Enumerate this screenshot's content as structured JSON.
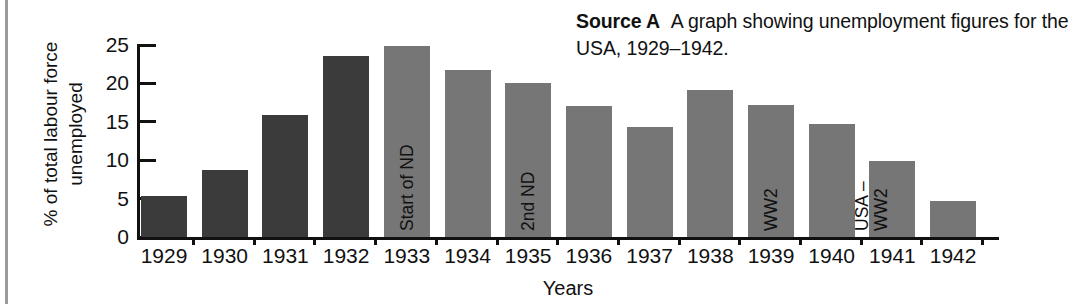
{
  "caption": {
    "source_label": "Source A",
    "description": "A graph showing unemployment figures for the USA, 1929–1942."
  },
  "colors": {
    "bar_dark": "#3b3b3b",
    "bar_light": "#767676",
    "axis": "#111111",
    "text": "#111111",
    "page_edge_rule": "#9a9a9a",
    "background": "#ffffff"
  },
  "chart_data": {
    "type": "bar",
    "title": "",
    "xlabel": "Years",
    "ylabel_line1": "% of total labour force",
    "ylabel_line2": "unemployed",
    "categories": [
      "1929",
      "1930",
      "1931",
      "1932",
      "1933",
      "1934",
      "1935",
      "1936",
      "1937",
      "1938",
      "1939",
      "1940",
      "1941",
      "1942"
    ],
    "values": [
      5.3,
      8.7,
      15.9,
      23.6,
      24.9,
      21.8,
      20.1,
      17.0,
      14.3,
      19.1,
      17.2,
      14.7,
      9.9,
      4.7
    ],
    "ylim": [
      0,
      25
    ],
    "yticks": [
      0,
      5,
      10,
      15,
      20,
      25
    ],
    "ytick_labels": [
      "0",
      "5",
      "10",
      "15",
      "20",
      "25"
    ],
    "grid": false,
    "legend": "none",
    "bar_shades": [
      "dark",
      "dark",
      "dark",
      "dark",
      "light",
      "light",
      "light",
      "light",
      "light",
      "light",
      "light",
      "light",
      "light",
      "light"
    ],
    "annotations": [
      {
        "category": "1933",
        "lines": [
          "Start of ND"
        ]
      },
      {
        "category": "1935",
        "lines": [
          "2nd ND"
        ]
      },
      {
        "category": "1939",
        "lines": [
          "WW2"
        ]
      },
      {
        "category": "1941",
        "lines": [
          "USA –",
          "WW2"
        ]
      }
    ]
  }
}
